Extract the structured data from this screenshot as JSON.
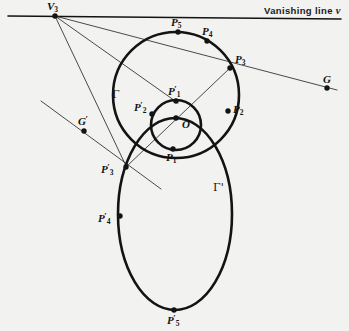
{
  "figure": {
    "kind": "projective-geometry-diagram",
    "background_color": "#f2f2f0",
    "ink_color": "#131313",
    "thin_line_color": "#2b2b2b",
    "width": 349,
    "height": 331
  },
  "annotations": {
    "vanishing_line_label": "Vanishing line",
    "vanishing_line_symbol": "v"
  },
  "curves": [
    {
      "id": "gamma",
      "label": "Γ",
      "type": "circle",
      "cx": 176,
      "cy": 95,
      "r": 63,
      "label_x": 112,
      "label_y": 89
    },
    {
      "id": "gamma-prime-small",
      "label": "",
      "type": "circle",
      "cx": 176,
      "cy": 125,
      "r": 25,
      "label_x": 0,
      "label_y": 0
    },
    {
      "id": "gamma-prime",
      "label": "Γ'",
      "type": "ellipse",
      "cx": 175,
      "cy": 214,
      "rx": 57,
      "ry": 96,
      "label_x": 213,
      "label_y": 182
    }
  ],
  "lines": [
    {
      "id": "vanishing-line",
      "x1": 8,
      "y1": 16,
      "x2": 341,
      "y2": 19,
      "weight": "medium"
    },
    {
      "id": "v3-to-G",
      "x1": 55,
      "y1": 16,
      "x2": 337,
      "y2": 90,
      "weight": "thin"
    },
    {
      "id": "v3-to-P1prime",
      "x1": 55,
      "y1": 16,
      "x2": 178,
      "y2": 103,
      "weight": "thin"
    },
    {
      "id": "v3-to-P3prime",
      "x1": 55,
      "y1": 16,
      "x2": 127,
      "y2": 168,
      "weight": "thin"
    },
    {
      "id": "P3-to-P3prime",
      "x1": 230,
      "y1": 68,
      "x2": 126,
      "y2": 167,
      "weight": "thin"
    },
    {
      "id": "Gprime-line",
      "x1": 41,
      "y1": 101,
      "x2": 161,
      "y2": 189,
      "weight": "thin"
    }
  ],
  "points": [
    {
      "id": "V3",
      "x": 55,
      "y": 16,
      "label": "V",
      "sub": "3",
      "prime": false,
      "label_x": 47,
      "label_y": 1
    },
    {
      "id": "G",
      "x": 327,
      "y": 88,
      "label": "G",
      "sub": "",
      "prime": false,
      "label_x": 323,
      "label_y": 74
    },
    {
      "id": "P5",
      "x": 178,
      "y": 32,
      "label": "P",
      "sub": "5",
      "prime": false,
      "label_x": 171,
      "label_y": 17
    },
    {
      "id": "P4",
      "x": 207,
      "y": 41,
      "label": "P",
      "sub": "4",
      "prime": false,
      "label_x": 202,
      "label_y": 26
    },
    {
      "id": "P3",
      "x": 230,
      "y": 68,
      "label": "P",
      "sub": "3",
      "prime": false,
      "label_x": 235,
      "label_y": 54
    },
    {
      "id": "P2",
      "x": 228,
      "y": 111,
      "label": "P",
      "sub": "2",
      "prime": false,
      "label_x": 233,
      "label_y": 104
    },
    {
      "id": "P1",
      "x": 173,
      "y": 149,
      "label": "P",
      "sub": "1",
      "prime": false,
      "label_x": 166,
      "label_y": 152
    },
    {
      "id": "P1p",
      "x": 176,
      "y": 101,
      "label": "P",
      "sub": "1",
      "prime": true,
      "label_x": 168,
      "label_y": 85
    },
    {
      "id": "P2p",
      "x": 152,
      "y": 114,
      "label": "P",
      "sub": "2",
      "prime": true,
      "label_x": 134,
      "label_y": 101
    },
    {
      "id": "P3p",
      "x": 126,
      "y": 167,
      "label": "P",
      "sub": "3",
      "prime": true,
      "label_x": 101,
      "label_y": 163
    },
    {
      "id": "P4p",
      "x": 120,
      "y": 216,
      "label": "P",
      "sub": "4",
      "prime": true,
      "label_x": 98,
      "label_y": 212
    },
    {
      "id": "P5p",
      "x": 174,
      "y": 310,
      "label": "P",
      "sub": "5",
      "prime": true,
      "label_x": 167,
      "label_y": 314
    },
    {
      "id": "O",
      "x": 176,
      "y": 118,
      "label": "O",
      "sub": "",
      "prime": false,
      "label_x": 182,
      "label_y": 119
    },
    {
      "id": "Gp",
      "x": 84,
      "y": 131,
      "label": "G",
      "sub": "",
      "prime": true,
      "label_x": 78,
      "label_y": 115
    }
  ]
}
